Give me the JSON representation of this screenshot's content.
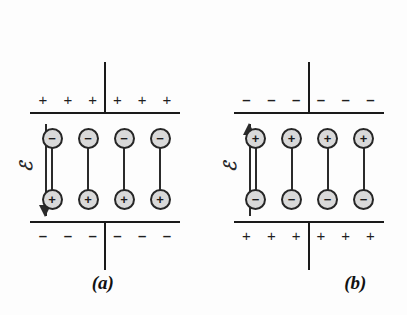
{
  "figure": {
    "background_color": "#fdfdfd",
    "line_color": "#1a1a1a",
    "ion_fill_color": "#d9d9d9",
    "ion_border_color": "#262626",
    "field_symbol": "ℰ",
    "plus_sign": "+",
    "minus_sign": "–"
  },
  "panels": [
    {
      "id": "a",
      "caption": "(a)",
      "field": {
        "label": "ℰ",
        "direction": "down",
        "name": "electric-field-arrow-down"
      },
      "top_plate": {
        "charge_sign": "+",
        "charges": [
          "+",
          "+",
          "+",
          "+",
          "+",
          "+"
        ],
        "count": 6
      },
      "bottom_plate": {
        "charge_sign": "–",
        "charges": [
          "–",
          "–",
          "–",
          "–",
          "–",
          "–"
        ],
        "count": 6
      },
      "dipoles": {
        "count": 4,
        "top_charge": "−",
        "bottom_charge": "+",
        "items": [
          {
            "top": "−",
            "bottom": "+"
          },
          {
            "top": "−",
            "bottom": "+"
          },
          {
            "top": "−",
            "bottom": "+"
          },
          {
            "top": "−",
            "bottom": "+"
          }
        ]
      }
    },
    {
      "id": "b",
      "caption": "(b)",
      "field": {
        "label": "ℰ",
        "direction": "up",
        "name": "electric-field-arrow-up"
      },
      "top_plate": {
        "charge_sign": "–",
        "charges": [
          "–",
          "–",
          "–",
          "–",
          "–",
          "–"
        ],
        "count": 6
      },
      "bottom_plate": {
        "charge_sign": "+",
        "charges": [
          "+",
          "+",
          "+",
          "+",
          "+",
          "+"
        ],
        "count": 6
      },
      "dipoles": {
        "count": 4,
        "top_charge": "+",
        "bottom_charge": "−",
        "items": [
          {
            "top": "+",
            "bottom": "−"
          },
          {
            "top": "+",
            "bottom": "−"
          },
          {
            "top": "+",
            "bottom": "−"
          },
          {
            "top": "+",
            "bottom": "−"
          }
        ]
      }
    }
  ]
}
